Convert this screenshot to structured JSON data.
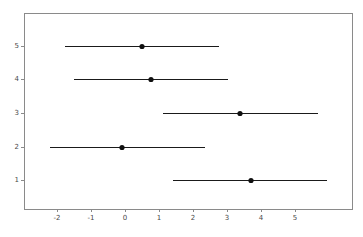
{
  "chart_data": {
    "type": "scatter",
    "title": "",
    "subtitle": "",
    "xlabel": "",
    "ylabel": "",
    "grid": false,
    "legend": false,
    "legend_position": "none",
    "orientation": "horizontal",
    "xlim": [
      -2.6,
      5.6
    ],
    "ylim": [
      0.45,
      5.75
    ],
    "xticks": [
      -2,
      -1,
      0,
      1,
      2,
      3,
      4,
      5
    ],
    "xtick_labels": [
      "-2",
      "-1",
      "0",
      "1",
      "2",
      "3",
      "4",
      "5"
    ],
    "yticks": [
      1,
      2,
      3,
      4,
      5
    ],
    "ytick_labels": [
      "1",
      "2",
      "3",
      "4",
      "5"
    ],
    "categories": [
      5,
      4,
      3,
      2,
      1
    ],
    "series": [
      {
        "name": "estimate",
        "values": [
          0.5,
          0.76,
          3.38,
          -0.09,
          3.7
        ]
      },
      {
        "name": "lower",
        "values": [
          -1.76,
          -1.5,
          1.12,
          -2.21,
          1.41
        ]
      },
      {
        "name": "upper",
        "values": [
          2.76,
          3.03,
          5.68,
          2.35,
          5.94
        ]
      }
    ],
    "points": [
      {
        "category": 5,
        "estimate": 0.5,
        "lower": -1.76,
        "upper": 2.76,
        "pixel_estimate": 142,
        "pixel_lower": 65,
        "pixel_upper": 219,
        "pixel_y": 46
      },
      {
        "category": 4,
        "estimate": 0.76,
        "lower": -1.5,
        "upper": 3.03,
        "pixel_estimate": 151,
        "pixel_lower": 74,
        "pixel_upper": 228,
        "pixel_y": 79
      },
      {
        "category": 3,
        "estimate": 3.38,
        "lower": 1.12,
        "upper": 5.68,
        "pixel_estimate": 240,
        "pixel_lower": 163,
        "pixel_upper": 318,
        "pixel_y": 113
      },
      {
        "category": 2,
        "estimate": -0.09,
        "lower": -2.21,
        "upper": 2.35,
        "pixel_estimate": 122,
        "pixel_lower": 50,
        "pixel_upper": 205,
        "pixel_y": 147
      },
      {
        "category": 1,
        "estimate": 3.7,
        "lower": 1.41,
        "upper": 5.94,
        "pixel_estimate": 251,
        "pixel_lower": 173,
        "pixel_upper": 327,
        "pixel_y": 180
      }
    ],
    "colors": {
      "marker": "#101010",
      "line": "#1a1a1a",
      "axis": "#8a8a8a",
      "tick_label": "#4a4a4a",
      "background": "#ffffff"
    }
  },
  "axes": {
    "x_tick_pixels": [
      57,
      91,
      125,
      159,
      193,
      227,
      261,
      295
    ],
    "y_tick_pixels": [
      180,
      147,
      113,
      79,
      46
    ],
    "frame": {
      "left": 24,
      "top": 13,
      "right": 352,
      "bottom": 209
    }
  }
}
